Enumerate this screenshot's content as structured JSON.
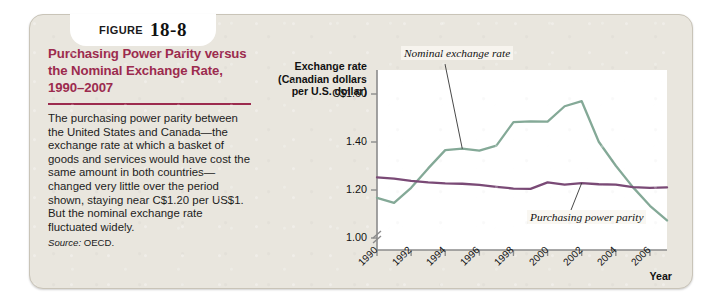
{
  "figure": {
    "tab_word": "FIGURE",
    "tab_number": "18-8",
    "title": "Purchasing Power Parity versus the Nominal Exchange Rate, 1990–2007",
    "body": "The purchasing power parity between the United States and Canada—the exchange rate at which a basket of goods and services would have cost the same amount in both countries—changed very little over the period shown, staying near C$1.20 per US$1. But the nominal exchange rate fluctuated widely.",
    "source_label": "Source:",
    "source_value": "OECD.",
    "accent_color": "#9c2b4e",
    "card_color": "#e9e6de"
  },
  "chart_data": {
    "type": "line",
    "title": "",
    "ylabel": "Exchange rate (Canadian dollars per U.S. dollar)",
    "ylabel_lines": [
      "Exchange rate",
      "(Canadian dollars",
      "per U.S. dollar)"
    ],
    "xlabel": "Year",
    "ylim": [
      0.95,
      1.7
    ],
    "axis_break": true,
    "yticks": [
      1.6,
      1.4,
      1.2,
      1.0
    ],
    "ytick_labels": [
      "C$1.60",
      "1.40",
      "1.20",
      "1.00"
    ],
    "xlim": [
      1990,
      2007
    ],
    "xticks": [
      1990,
      1992,
      1994,
      1996,
      1998,
      2000,
      2002,
      2004,
      2006
    ],
    "xtick_labels": [
      "1990",
      "1992",
      "1994",
      "1996",
      "1998",
      "2000",
      "2002",
      "2004",
      "2006"
    ],
    "grid": false,
    "legend": "inline-annotations",
    "x": [
      1990,
      1991,
      1992,
      1993,
      1994,
      1995,
      1996,
      1997,
      1998,
      1999,
      2000,
      2001,
      2002,
      2003,
      2004,
      2005,
      2006,
      2007
    ],
    "series": [
      {
        "name": "Nominal exchange rate",
        "color": "#84a997",
        "values": [
          1.167,
          1.146,
          1.209,
          1.29,
          1.366,
          1.372,
          1.364,
          1.385,
          1.483,
          1.486,
          1.485,
          1.549,
          1.57,
          1.401,
          1.301,
          1.212,
          1.134,
          1.073
        ]
      },
      {
        "name": "Purchasing power parity",
        "color": "#7a4a76",
        "values": [
          1.253,
          1.247,
          1.238,
          1.232,
          1.228,
          1.226,
          1.221,
          1.213,
          1.206,
          1.205,
          1.232,
          1.222,
          1.229,
          1.224,
          1.222,
          1.212,
          1.209,
          1.211
        ]
      }
    ],
    "annotations": [
      {
        "text": "Nominal exchange rate",
        "target_x": 1995,
        "target_y": 1.372
      },
      {
        "text": "Purchasing power parity",
        "target_x": 2002,
        "target_y": 1.229
      }
    ]
  }
}
